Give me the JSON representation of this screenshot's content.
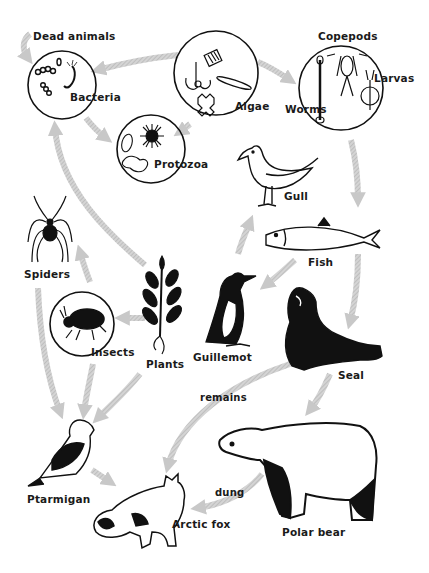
{
  "colors": {
    "ink": "#111111",
    "arrow": "#cfcfcf",
    "arrow_hatch": "#b3b3b3",
    "background": "#ffffff"
  },
  "nodes": {
    "dead_animals": {
      "label": "Dead animals"
    },
    "bacteria": {
      "label": "Bacteria"
    },
    "algae": {
      "label": "Algae"
    },
    "copepods": {
      "label": "Copepods"
    },
    "larvas": {
      "label": "Larvas"
    },
    "worms": {
      "label": "Worms"
    },
    "protozoa": {
      "label": "Protozoa"
    },
    "gull": {
      "label": "Gull"
    },
    "fish": {
      "label": "Fish"
    },
    "spiders": {
      "label": "Spiders"
    },
    "insects": {
      "label": "Insects"
    },
    "plants": {
      "label": "Plants"
    },
    "guillemot": {
      "label": "Guillemot"
    },
    "seal": {
      "label": "Seal"
    },
    "ptarmigan": {
      "label": "Ptarmigan"
    },
    "arctic_fox": {
      "label": "Arctic fox"
    },
    "polar_bear": {
      "label": "Polar bear"
    }
  },
  "edge_labels": {
    "remains": "remains",
    "dung": "dung"
  },
  "edges": [
    {
      "from": "Dead animals",
      "to": "Bacteria"
    },
    {
      "from": "Algae",
      "to": "Bacteria"
    },
    {
      "from": "Bacteria",
      "to": "Protozoa"
    },
    {
      "from": "Algae",
      "to": "Protozoa"
    },
    {
      "from": "Algae",
      "to": "Copepods/Worms/Larvas"
    },
    {
      "from": "Copepods/Worms/Larvas",
      "to": "Fish"
    },
    {
      "from": "Fish",
      "to": "Seal"
    },
    {
      "from": "Fish",
      "to": "Guillemot"
    },
    {
      "from": "Guillemot",
      "to": "Gull"
    },
    {
      "from": "Plants",
      "to": "Bacteria"
    },
    {
      "from": "Plants",
      "to": "Insects"
    },
    {
      "from": "Insects",
      "to": "Spiders"
    },
    {
      "from": "Spiders",
      "to": "Ptarmigan"
    },
    {
      "from": "Insects",
      "to": "Ptarmigan"
    },
    {
      "from": "Plants",
      "to": "Ptarmigan"
    },
    {
      "from": "Ptarmigan",
      "to": "Arctic fox"
    },
    {
      "from": "Seal",
      "to": "Arctic fox",
      "label": "remains"
    },
    {
      "from": "Seal",
      "to": "Polar bear"
    },
    {
      "from": "Polar bear",
      "to": "Arctic fox",
      "label": "dung"
    }
  ]
}
